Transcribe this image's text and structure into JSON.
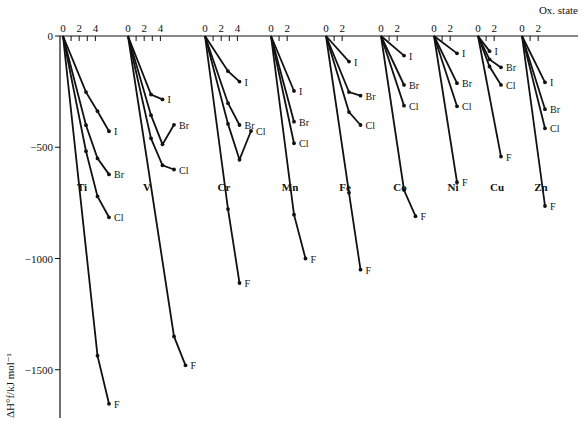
{
  "chart_data": {
    "type": "line",
    "title": "",
    "xlabel": "Ox. state",
    "ylabel": "ΔH°f/kJ mol⁻¹",
    "ylim": [
      -1700,
      0
    ],
    "yticks": [
      0,
      -500,
      -1000,
      -1500
    ],
    "ytick_labels": [
      "0",
      "−500",
      "−1000",
      "−1500"
    ],
    "grid": false,
    "legend": "inline labels at line ends",
    "halides": [
      "F",
      "Cl",
      "Br",
      "I"
    ],
    "elements": [
      {
        "name": "Ti",
        "xticks": [
          "0",
          "2",
          "4"
        ],
        "series": [
          {
            "halide": "I",
            "x": [
              0,
              2,
              3,
              4
            ],
            "y": [
              0,
              -252,
              -338,
              -428
            ]
          },
          {
            "halide": "Br",
            "x": [
              0,
              2,
              3,
              4
            ],
            "y": [
              0,
              -401,
              -550,
              -622
            ]
          },
          {
            "halide": "Cl",
            "x": [
              0,
              2,
              3,
              4
            ],
            "y": [
              0,
              -518,
              -721,
              -815
            ]
          },
          {
            "halide": "F",
            "x": [
              0,
              3,
              4
            ],
            "y": [
              0,
              -1437,
              -1653
            ]
          }
        ]
      },
      {
        "name": "V",
        "xticks": [
          "0",
          "2",
          "4"
        ],
        "series": [
          {
            "halide": "I",
            "x": [
              0,
              2,
              3
            ],
            "y": [
              0,
              -263,
              -285
            ]
          },
          {
            "halide": "Br",
            "x": [
              0,
              2,
              3,
              4
            ],
            "y": [
              0,
              -356,
              -487,
              -399
            ]
          },
          {
            "halide": "Cl",
            "x": [
              0,
              2,
              3,
              4
            ],
            "y": [
              0,
              -460,
              -581,
              -600
            ]
          },
          {
            "halide": "F",
            "x": [
              0,
              4,
              5
            ],
            "y": [
              0,
              -1350,
              -1480
            ]
          }
        ]
      },
      {
        "name": "Cr",
        "xticks": [
          "0",
          "2",
          "4"
        ],
        "series": [
          {
            "halide": "I",
            "x": [
              0,
              2,
              3
            ],
            "y": [
              0,
              -158,
              -205
            ]
          },
          {
            "halide": "Br",
            "x": [
              0,
              2,
              3
            ],
            "y": [
              0,
              -302,
              -400
            ]
          },
          {
            "halide": "Cl",
            "x": [
              0,
              2,
              3,
              4
            ],
            "y": [
              0,
              -395,
              -556,
              -427
            ]
          },
          {
            "halide": "F",
            "x": [
              0,
              2,
              3
            ],
            "y": [
              0,
              -778,
              -1110
            ]
          }
        ]
      },
      {
        "name": "Mn",
        "xticks": [
          "0",
          "2"
        ],
        "series": [
          {
            "halide": "I",
            "x": [
              0,
              2
            ],
            "y": [
              0,
              -247
            ]
          },
          {
            "halide": "Br",
            "x": [
              0,
              2
            ],
            "y": [
              0,
              -385
            ]
          },
          {
            "halide": "Cl",
            "x": [
              0,
              2
            ],
            "y": [
              0,
              -482
            ]
          },
          {
            "halide": "F",
            "x": [
              0,
              2,
              3
            ],
            "y": [
              0,
              -803,
              -1000
            ]
          }
        ]
      },
      {
        "name": "Fe",
        "xticks": [
          "0",
          "2"
        ],
        "series": [
          {
            "halide": "I",
            "x": [
              0,
              2
            ],
            "y": [
              0,
              -115
            ]
          },
          {
            "halide": "Br",
            "x": [
              0,
              2,
              3
            ],
            "y": [
              0,
              -252,
              -268
            ]
          },
          {
            "halide": "Cl",
            "x": [
              0,
              2,
              3
            ],
            "y": [
              0,
              -342,
              -400
            ]
          },
          {
            "halide": "F",
            "x": [
              0,
              2,
              3
            ],
            "y": [
              0,
              -705,
              -1050
            ]
          }
        ]
      },
      {
        "name": "Co",
        "xticks": [
          "0",
          "2"
        ],
        "series": [
          {
            "halide": "I",
            "x": [
              0,
              2
            ],
            "y": [
              0,
              -88
            ]
          },
          {
            "halide": "Br",
            "x": [
              0,
              2
            ],
            "y": [
              0,
              -220
            ]
          },
          {
            "halide": "Cl",
            "x": [
              0,
              2
            ],
            "y": [
              0,
              -313
            ]
          },
          {
            "halide": "F",
            "x": [
              0,
              2,
              3
            ],
            "y": [
              0,
              -692,
              -810
            ]
          }
        ]
      },
      {
        "name": "Ni",
        "xticks": [
          "0",
          "2"
        ],
        "series": [
          {
            "halide": "I",
            "x": [
              0,
              2
            ],
            "y": [
              0,
              -78
            ]
          },
          {
            "halide": "Br",
            "x": [
              0,
              2
            ],
            "y": [
              0,
              -212
            ]
          },
          {
            "halide": "Cl",
            "x": [
              0,
              2
            ],
            "y": [
              0,
              -316
            ]
          },
          {
            "halide": "F",
            "x": [
              0,
              2
            ],
            "y": [
              0,
              -657
            ]
          }
        ]
      },
      {
        "name": "Cu",
        "xticks": [
          "0",
          "2"
        ],
        "series": [
          {
            "halide": "I",
            "x": [
              0,
              1
            ],
            "y": [
              0,
              -68
            ]
          },
          {
            "halide": "Br",
            "x": [
              0,
              1,
              2
            ],
            "y": [
              0,
              -105,
              -141
            ]
          },
          {
            "halide": "Cl",
            "x": [
              0,
              1,
              2
            ],
            "y": [
              0,
              -137,
              -220
            ]
          },
          {
            "halide": "F",
            "x": [
              0,
              2
            ],
            "y": [
              0,
              -542
            ]
          }
        ]
      },
      {
        "name": "Zn",
        "xticks": [
          "0",
          "2"
        ],
        "series": [
          {
            "halide": "I",
            "x": [
              0,
              2
            ],
            "y": [
              0,
              -208
            ]
          },
          {
            "halide": "Br",
            "x": [
              0,
              2
            ],
            "y": [
              0,
              -329
            ]
          },
          {
            "halide": "Cl",
            "x": [
              0,
              2
            ],
            "y": [
              0,
              -415
            ]
          },
          {
            "halide": "F",
            "x": [
              0,
              2
            ],
            "y": [
              0,
              -764
            ]
          }
        ]
      }
    ]
  },
  "layout": {
    "origin_x": [
      63,
      128,
      205,
      271,
      326,
      381,
      434,
      478,
      522
    ],
    "element_label_y": 191,
    "unit_px": 11.5,
    "y0": 36,
    "y_scale": 0.2225
  }
}
